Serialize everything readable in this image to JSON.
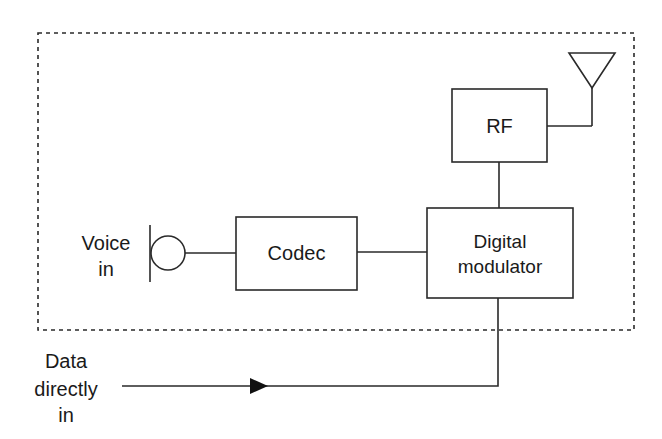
{
  "diagram": {
    "type": "block-diagram",
    "enclosure": {
      "style": "dotted",
      "label": ""
    },
    "blocks": {
      "rf": {
        "label": "RF"
      },
      "codec": {
        "label": "Codec"
      },
      "modulator": {
        "line1": "Digital",
        "line2": "modulator"
      }
    },
    "inputs": {
      "voice": {
        "line1": "Voice",
        "line2": "in",
        "icon": "microphone-icon"
      },
      "data": {
        "line1": "Data",
        "line2": "directly",
        "line3": "in"
      }
    },
    "antenna": {
      "icon": "antenna-icon"
    },
    "connections": [
      {
        "from": "voice-microphone",
        "to": "codec"
      },
      {
        "from": "codec",
        "to": "digital-modulator"
      },
      {
        "from": "digital-modulator",
        "to": "rf"
      },
      {
        "from": "rf",
        "to": "antenna"
      },
      {
        "from": "data-directly-in",
        "to": "digital-modulator",
        "arrow": true
      }
    ]
  }
}
